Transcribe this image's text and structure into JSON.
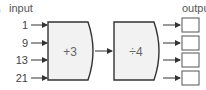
{
  "diagram": {
    "input_label": "input",
    "output_label": "output",
    "inputs": [
      "1",
      "9",
      "13",
      "21"
    ],
    "machines": [
      {
        "operation": "+3"
      },
      {
        "operation": "÷4"
      }
    ],
    "outputs": [
      "",
      "",
      "",
      ""
    ],
    "colors": {
      "box_fill": "#f2f2f2",
      "box_stroke": "#333333",
      "arrow": "#333333",
      "output_box_stroke": "#555555"
    }
  }
}
